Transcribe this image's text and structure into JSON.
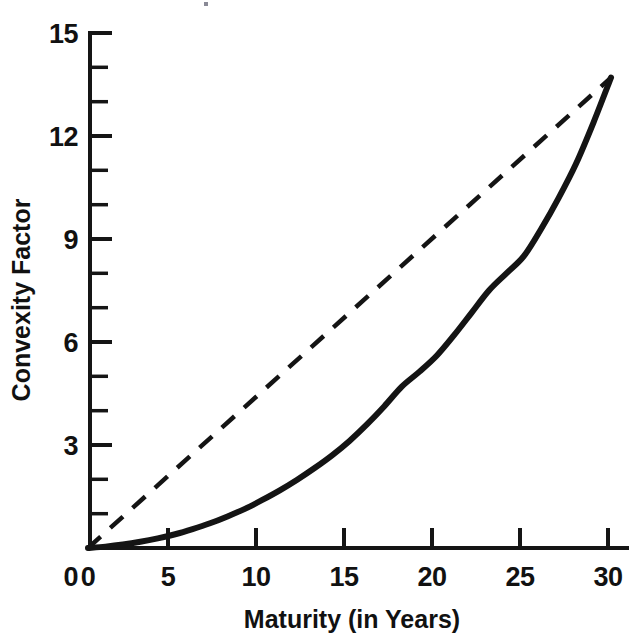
{
  "chart_data": {
    "type": "line",
    "title": "",
    "subtitle": "",
    "xlabel": "Maturity (in Years)",
    "ylabel": "Convexity Factor",
    "xlim": [
      0,
      30
    ],
    "ylim": [
      0,
      15
    ],
    "grid": false,
    "legend": "none",
    "background": "#ffffff",
    "ink_color": "#141414",
    "x_ticks": [
      0,
      5,
      10,
      15,
      20,
      25,
      30
    ],
    "x_ticklabels": [
      "0",
      "5",
      "10",
      "15",
      "20",
      "25",
      "30"
    ],
    "x_minor_ticks": [],
    "y_ticks": [
      0,
      3,
      6,
      9,
      12,
      15
    ],
    "y_ticklabels": [
      "0",
      "3",
      "6",
      "9",
      "12",
      "15"
    ],
    "y_minor_ticks": [
      1,
      2,
      4,
      5,
      7,
      8,
      10,
      11,
      13,
      14
    ],
    "series": [
      {
        "name": "Convexity (actual)",
        "style": "solid",
        "x": [
          0,
          1,
          2,
          3,
          4,
          5,
          6,
          7,
          8,
          9,
          10,
          11,
          12,
          13,
          14,
          15,
          16,
          17,
          18,
          19,
          20,
          21,
          22,
          23,
          24,
          25,
          26,
          27,
          28,
          29,
          30
        ],
        "values": [
          0.0,
          0.04,
          0.1,
          0.18,
          0.28,
          0.4,
          0.55,
          0.72,
          0.92,
          1.14,
          1.4,
          1.68,
          1.99,
          2.33,
          2.7,
          3.12,
          3.6,
          4.13,
          4.7,
          5.13,
          5.6,
          6.2,
          6.85,
          7.5,
          8.0,
          8.5,
          9.3,
          10.2,
          11.2,
          12.4,
          13.7
        ]
      },
      {
        "name": "Linear reference",
        "style": "dashed",
        "x": [
          0,
          30
        ],
        "values": [
          0.0,
          13.7
        ]
      }
    ]
  },
  "axes": {
    "y_title": "Convexity Factor",
    "x_title": "Maturity (in Years)"
  },
  "labels": {
    "y_0": "0",
    "y_3": "3",
    "y_6": "6",
    "y_9": "9",
    "y_12": "12",
    "y_15": "15",
    "x_0": "0",
    "x_5": "5",
    "x_10": "10",
    "x_15": "15",
    "x_20": "20",
    "x_25": "25",
    "x_30": "30"
  }
}
